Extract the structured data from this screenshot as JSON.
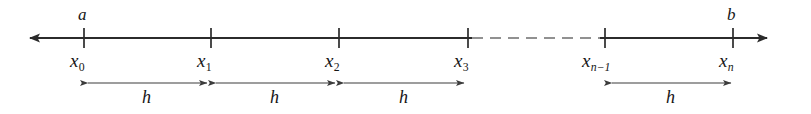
{
  "figure": {
    "colors": {
      "background": "#ffffff",
      "line": "#2b2b2b",
      "tick": "#2b2b2b",
      "text": "#161616",
      "dash": "#6e6e6e",
      "measure_arrow": "#3c3c3c"
    }
  },
  "axis": {
    "name": "number-line",
    "y": 38,
    "left_arrow_tip_x": 25,
    "right_arrow_tip_x": 772,
    "solid_segments": [
      {
        "x1": 25,
        "x2": 472
      },
      {
        "x1": 600,
        "x2": 772
      }
    ],
    "dashed_segment": {
      "x1": 472,
      "x2": 600,
      "dash_count": 7
    },
    "arrowheads": [
      "left",
      "right"
    ]
  },
  "endpoint_labels": [
    {
      "name": "label-a",
      "text": "a",
      "x": 84,
      "y": 8
    },
    {
      "name": "label-b",
      "text": "b",
      "x": 733,
      "y": 8
    }
  ],
  "nodes": [
    {
      "name": "tick-x0",
      "label_base": "x",
      "label_sub": "0",
      "sub_italic": false,
      "x": 84,
      "tick_top": 28,
      "tick_bottom": 48
    },
    {
      "name": "tick-x1",
      "label_base": "x",
      "label_sub": "1",
      "sub_italic": false,
      "x": 211,
      "tick_top": 28,
      "tick_bottom": 48
    },
    {
      "name": "tick-x2",
      "label_base": "x",
      "label_sub": "2",
      "sub_italic": false,
      "x": 339,
      "tick_top": 28,
      "tick_bottom": 48
    },
    {
      "name": "tick-x3",
      "label_base": "x",
      "label_sub": "3",
      "sub_italic": false,
      "x": 468,
      "tick_top": 28,
      "tick_bottom": 48
    },
    {
      "name": "tick-xn-1",
      "label_base": "x",
      "label_sub": "n−1",
      "sub_italic": true,
      "x": 605,
      "tick_top": 28,
      "tick_bottom": 48
    },
    {
      "name": "tick-xn",
      "label_base": "x",
      "label_sub": "n",
      "sub_italic": true,
      "x": 733,
      "tick_top": 28,
      "tick_bottom": 48
    }
  ],
  "node_label_y": 50,
  "measures": [
    {
      "name": "step-h-0",
      "label": "h",
      "x1": 86,
      "x2": 209,
      "y": 83,
      "label_x": 147,
      "label_y": 88
    },
    {
      "name": "step-h-1",
      "label": "h",
      "x1": 214,
      "x2": 337,
      "y": 83,
      "label_x": 275,
      "label_y": 88
    },
    {
      "name": "step-h-2",
      "label": "h",
      "x1": 342,
      "x2": 466,
      "y": 83,
      "label_x": 404,
      "label_y": 88
    },
    {
      "name": "step-h-3",
      "label": "h",
      "x1": 610,
      "x2": 733,
      "y": 83,
      "label_x": 671,
      "label_y": 88
    }
  ]
}
